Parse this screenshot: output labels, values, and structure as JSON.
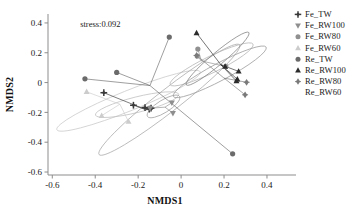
{
  "figure": {
    "annotation": "stress:0.092",
    "background": "#ffffff"
  },
  "axes": {
    "xlabel": "NMDS1",
    "ylabel": "NMDS2",
    "xticks": [
      "-0.6",
      "-0.4",
      "-0.2",
      "0",
      "0.2",
      "0.4"
    ],
    "yticks": [
      "0.4",
      "0.2",
      "0",
      "-0.2",
      "-0.4",
      "-0.6"
    ]
  },
  "legend": {
    "items": [
      {
        "label": "Fe_TW",
        "marker": "plus-icon",
        "color": "#3a3a3a"
      },
      {
        "label": "Fe_RW100",
        "marker": "triangle-down-icon",
        "color": "#8e8e8e"
      },
      {
        "label": "Fe_RW80",
        "marker": "circle-icon",
        "color": "#909090"
      },
      {
        "label": "Fe_RW60",
        "marker": "triangle-up-icon",
        "color": "#cccccc"
      },
      {
        "label": "Re_TW",
        "marker": "circle-icon",
        "color": "#6b6b6b"
      },
      {
        "label": "Re_RW100",
        "marker": "triangle-up-icon",
        "color": "#2b2b2b"
      },
      {
        "label": "Re_RW80",
        "marker": "diamond-icon",
        "color": "#7a7a7a"
      },
      {
        "label": "Re_RW60",
        "marker": "none",
        "color": "#bdbdbd"
      }
    ]
  },
  "chart_data": {
    "type": "scatter",
    "title": "",
    "subtitle": "",
    "xlabel": "NMDS1",
    "ylabel": "NMDS2",
    "xlim": [
      -0.62,
      0.47
    ],
    "ylim": [
      -0.62,
      0.46
    ],
    "grid": false,
    "legend_position": "right",
    "annotations": [
      {
        "text": "stress:0.092",
        "x": -0.47,
        "y": 0.39
      }
    ],
    "series": [
      {
        "name": "Fe_TW",
        "marker": "plus",
        "color": "#3a3a3a",
        "centroid": [
          -0.175,
          -0.175
        ],
        "points": [
          [
            -0.36,
            -0.068
          ],
          [
            -0.222,
            -0.152
          ],
          [
            -0.168,
            -0.168
          ],
          [
            -0.148,
            -0.178
          ],
          [
            -0.14,
            -0.172
          ]
        ]
      },
      {
        "name": "Fe_RW100",
        "marker": "triangle-down",
        "color": "#8e8e8e",
        "centroid": [
          -0.075,
          -0.165
        ],
        "points": [
          [
            -0.043,
            -0.135
          ],
          [
            -0.038,
            -0.205
          ],
          [
            -0.145,
            -0.172
          ]
        ]
      },
      {
        "name": "Fe_RW80",
        "marker": "circle",
        "color": "#909090",
        "centroid": [
          0.095,
          0.145
        ],
        "points": [
          [
            0.078,
            0.225
          ],
          [
            0.075,
            0.178
          ],
          [
            0.208,
            0.108
          ]
        ]
      },
      {
        "name": "Fe_RW60",
        "marker": "triangle-up",
        "color": "#cccccc",
        "centroid": [
          -0.285,
          -0.145
        ],
        "points": [
          [
            -0.44,
            -0.062
          ],
          [
            -0.37,
            -0.222
          ],
          [
            -0.245,
            -0.262
          ]
        ]
      },
      {
        "name": "Re_TW",
        "marker": "circle",
        "color": "#6b6b6b",
        "centroid": [
          -0.145,
          -0.02
        ],
        "points": [
          [
            -0.448,
            0.025
          ],
          [
            -0.3,
            0.068
          ],
          [
            -0.055,
            0.305
          ],
          [
            0.24,
            -0.478
          ]
        ]
      },
      {
        "name": "Re_RW100",
        "marker": "triangle-up",
        "color": "#2b2b2b",
        "centroid": [
          0.185,
          0.12
        ],
        "points": [
          [
            0.072,
            0.332
          ],
          [
            0.205,
            0.108
          ],
          [
            0.268,
            0.075
          ],
          [
            0.262,
            0.022
          ],
          [
            0.258,
            0.01
          ]
        ]
      },
      {
        "name": "Re_RW80",
        "marker": "diamond",
        "color": "#7a7a7a",
        "centroid": [
          0.2,
          0.03
        ],
        "points": [
          [
            0.072,
            0.182
          ],
          [
            0.305,
            0.002
          ],
          [
            0.298,
            -0.082
          ]
        ]
      },
      {
        "name": "Re_RW60",
        "marker": "none",
        "color": "#bdbdbd",
        "centroid": [
          0.19,
          0.085
        ],
        "points": []
      }
    ],
    "ellipses": [
      {
        "name": "ellipse-fe-rw60",
        "cx": -0.245,
        "cy": -0.122,
        "rx": 0.36,
        "ry": 0.068,
        "angle": -22,
        "color": "#c9c9c9"
      },
      {
        "name": "ellipse-fe-tw",
        "cx": -0.205,
        "cy": -0.148,
        "rx": 0.2,
        "ry": 0.052,
        "angle": -14,
        "color": "#bdbdbd"
      },
      {
        "name": "ellipse-re-tw",
        "cx": -0.055,
        "cy": -0.115,
        "rx": 0.415,
        "ry": 0.075,
        "angle": -38,
        "color": "#a8a8a8"
      },
      {
        "name": "ellipse-fe-rw100",
        "cx": -0.082,
        "cy": -0.16,
        "rx": 0.088,
        "ry": 0.042,
        "angle": -32,
        "color": "#9d9d9d"
      },
      {
        "name": "ellipse-fe-rw80",
        "cx": 0.142,
        "cy": 0.122,
        "rx": 0.215,
        "ry": 0.055,
        "angle": -26,
        "color": "#b4b4b4"
      },
      {
        "name": "ellipse-re-rw100",
        "cx": 0.17,
        "cy": 0.16,
        "rx": 0.19,
        "ry": 0.042,
        "angle": -40,
        "color": "#7f7f7f"
      },
      {
        "name": "ellipse-re-rw80",
        "cx": 0.18,
        "cy": 0.072,
        "rx": 0.245,
        "ry": 0.058,
        "angle": -28,
        "color": "#9a9a9a"
      }
    ]
  }
}
